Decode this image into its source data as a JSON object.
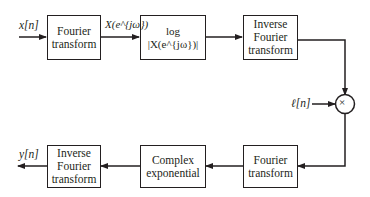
{
  "blocks": {
    "ft1": "Fourier transform",
    "log": "log |X(e^{jω})|",
    "ift1": "Inverse Fourier transform",
    "ft2": "Fourier transform",
    "cexp": "Complex exponential",
    "ift2": "Inverse Fourier transform"
  },
  "signals": {
    "input": "x[n]",
    "spectrum": "X(e^{jω})",
    "window": "ℓ[n]",
    "output": "y[n]",
    "multiplier": "×"
  }
}
